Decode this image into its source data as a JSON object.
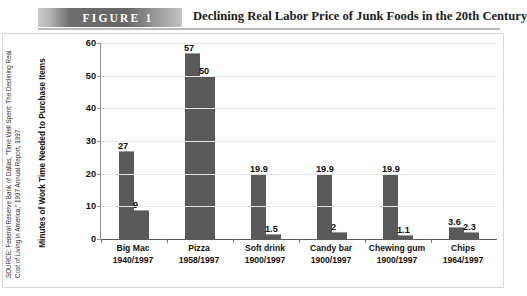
{
  "figure": {
    "tag_label": "FIGURE  1",
    "title": "Declining Real Labor Price of Junk Foods in the 20th Century",
    "source_note": "SOURCE: Federal Reserve Bank of Dallas, \"Time Well Spent: The Declining Real Cost of Living in America,\" 1997 Annual Report, 1997."
  },
  "chart_data": {
    "type": "bar",
    "title": "Declining Real Labor Price of Junk Foods in the 20th Century",
    "xlabel": "",
    "ylabel": "Minutes of Work Time Needed to Purchase Items",
    "ylim": [
      0,
      60
    ],
    "yticks": [
      0,
      10,
      20,
      30,
      40,
      50,
      60
    ],
    "ytick_labels": [
      "0",
      "10",
      "20",
      "30",
      "40",
      "50",
      "60"
    ],
    "grid": true,
    "legend": false,
    "categories": [
      "Big Mac",
      "Pizza",
      "Soft drink",
      "Candy bar",
      "Chewing gum",
      "Chips"
    ],
    "category_sublabels": [
      "1940/1997",
      "1958/1997",
      "1900/1997",
      "1900/1997",
      "1900/1997",
      "1964/1997"
    ],
    "series": [
      {
        "name": "Earlier year",
        "values": [
          27,
          57,
          19.9,
          19.9,
          19.9,
          3.6
        ],
        "value_labels": [
          "27",
          "57",
          "19.9",
          "19.9",
          "19.9",
          "3.6"
        ]
      },
      {
        "name": "1997",
        "values": [
          9,
          50,
          1.5,
          2,
          1.1,
          2.3
        ],
        "value_labels": [
          "9",
          "50",
          "1.5",
          "2",
          "1.1",
          "2.3"
        ]
      }
    ],
    "bar_color": "#595959",
    "bar_top_color": "#9d9d9d",
    "grid_color": "#e6e6e6",
    "axis_color": "#5c5c5c"
  }
}
